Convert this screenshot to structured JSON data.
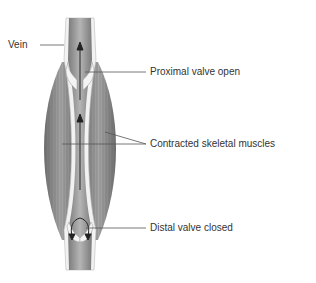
{
  "diagram": {
    "labels": {
      "vein": "Vein",
      "proximal_valve": "Proximal valve open",
      "muscles": "Contracted skeletal muscles",
      "distal_valve": "Distal valve closed"
    },
    "colors": {
      "muscle": "#8a8a8a",
      "vein_wall": "#f2f2f2",
      "vein_lumen": "#9a9a9a",
      "leader": "#555555",
      "text": "#333333"
    }
  }
}
